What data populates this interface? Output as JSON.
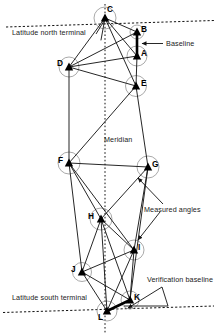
{
  "figure": {
    "colors": {
      "line": "#1a1a1a",
      "station": "#000000",
      "baseline": "#000000",
      "arc": "#8a8a8a",
      "dashed": "#111111",
      "background": "#ffffff"
    },
    "stations": [
      {
        "id": "A",
        "label": "A",
        "x": 137,
        "y": 56,
        "lx": 141,
        "ly": 51
      },
      {
        "id": "B",
        "label": "B",
        "x": 137,
        "y": 32,
        "lx": 141,
        "ly": 27
      },
      {
        "id": "C",
        "label": "C",
        "x": 105,
        "y": 18,
        "lx": 108,
        "ly": 8
      },
      {
        "id": "D",
        "label": "D",
        "x": 69,
        "y": 67,
        "lx": 57,
        "ly": 62
      },
      {
        "id": "E",
        "label": "E",
        "x": 136,
        "y": 86,
        "lx": 140,
        "ly": 81
      },
      {
        "id": "F",
        "label": "F",
        "x": 69,
        "y": 163,
        "lx": 58,
        "ly": 158
      },
      {
        "id": "G",
        "label": "G",
        "x": 148,
        "y": 167,
        "lx": 152,
        "ly": 162
      },
      {
        "id": "H",
        "label": "H",
        "x": 101,
        "y": 219,
        "lx": 89,
        "ly": 214
      },
      {
        "id": "I",
        "label": "I",
        "x": 134,
        "y": 250,
        "lx": 138,
        "ly": 245
      },
      {
        "id": "J",
        "label": "J",
        "x": 82,
        "y": 272,
        "lx": 71,
        "ly": 268
      },
      {
        "id": "K",
        "label": "K",
        "x": 130,
        "y": 300,
        "lx": 134,
        "ly": 295
      },
      {
        "id": "L",
        "label": "L",
        "x": 107,
        "y": 311,
        "lx": 99,
        "ly": 314
      }
    ],
    "edges": [
      [
        "C",
        "B"
      ],
      [
        "C",
        "A"
      ],
      [
        "C",
        "D"
      ],
      [
        "C",
        "E"
      ],
      [
        "B",
        "A"
      ],
      [
        "A",
        "D"
      ],
      [
        "A",
        "E"
      ],
      [
        "D",
        "E"
      ],
      [
        "D",
        "B"
      ],
      [
        "C",
        "L"
      ],
      [
        "D",
        "F"
      ],
      [
        "E",
        "G"
      ],
      [
        "E",
        "F"
      ],
      [
        "F",
        "G"
      ],
      [
        "F",
        "H"
      ],
      [
        "F",
        "I"
      ],
      [
        "G",
        "H"
      ],
      [
        "G",
        "I"
      ],
      [
        "G",
        "K"
      ],
      [
        "H",
        "I"
      ],
      [
        "H",
        "J"
      ],
      [
        "H",
        "K"
      ],
      [
        "H",
        "L"
      ],
      [
        "I",
        "J"
      ],
      [
        "I",
        "K"
      ],
      [
        "I",
        "L"
      ],
      [
        "J",
        "K"
      ],
      [
        "J",
        "L"
      ],
      [
        "K",
        "L"
      ]
    ],
    "baselines": [
      {
        "name": "baseline",
        "from": "B",
        "to": "A"
      },
      {
        "name": "verification-baseline",
        "from": "K",
        "to": "L"
      }
    ],
    "meridian": {
      "label": "Meridian",
      "x": 105,
      "y_top": 4,
      "y_bottom": 332,
      "label_x": 104,
      "label_y": 136
    },
    "terminals": [
      {
        "id": "north",
        "label": "Latitude north terminal",
        "label_x": 12,
        "label_y": 29,
        "line_x1": 6,
        "line_y1": 27,
        "line_x2": 214,
        "line_y2": 21
      },
      {
        "id": "south",
        "label": "Latitude south terminal",
        "label_x": 12,
        "label_y": 294,
        "line_x1": 4,
        "line_y1": 312,
        "line_x2": 214,
        "line_y2": 306
      }
    ],
    "annotations": [
      {
        "id": "baseline",
        "label": "Baseline",
        "x": 165,
        "y": 40
      },
      {
        "id": "measured-angles",
        "label": "Measured angles",
        "x": 144,
        "y": 207
      },
      {
        "id": "verification-baseline",
        "label": "Verification baseline",
        "x": 148,
        "y": 276
      }
    ]
  }
}
